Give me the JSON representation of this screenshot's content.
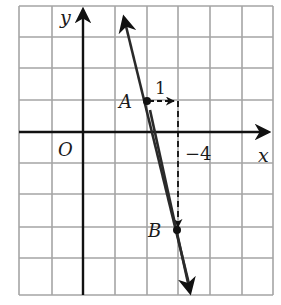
{
  "diagram": {
    "type": "coordinate-plane",
    "grid": {
      "x_lines": [
        19,
        52,
        83,
        115,
        147,
        178,
        210,
        242,
        273
      ],
      "y_lines": [
        6,
        37,
        68,
        100,
        132,
        163,
        194,
        227,
        258,
        295
      ],
      "color": "#9a9a9a"
    },
    "axes": {
      "x_label": "x",
      "y_label": "y",
      "origin_label": "O",
      "color": "#111111"
    },
    "points": [
      {
        "label": "A",
        "x": 147,
        "y": 101
      },
      {
        "label": "B",
        "x": 177,
        "y": 230
      }
    ],
    "annotations": {
      "run_label": "1",
      "tick_label": "−4"
    },
    "line": {
      "from": [
        121,
        8
      ],
      "to": [
        192,
        296
      ],
      "color": "#2a2a2a"
    }
  }
}
